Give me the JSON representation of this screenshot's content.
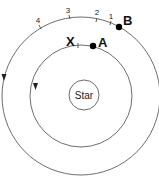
{
  "diagram": {
    "type": "orbits",
    "colors": {
      "line": "#6e6e6e",
      "text": "#111111",
      "dot": "#000000",
      "background": "#ffffff"
    },
    "star": {
      "label": "Star"
    },
    "inner_orbit": {
      "direction": "counterclockwise",
      "points": [
        {
          "label": "A",
          "role": "planet"
        },
        {
          "label": "X",
          "role": "marker"
        }
      ]
    },
    "outer_orbit": {
      "direction": "counterclockwise",
      "points": [
        {
          "label": "B",
          "role": "planet"
        }
      ],
      "tick_labels": [
        "1",
        "2",
        "3",
        "4"
      ]
    }
  }
}
